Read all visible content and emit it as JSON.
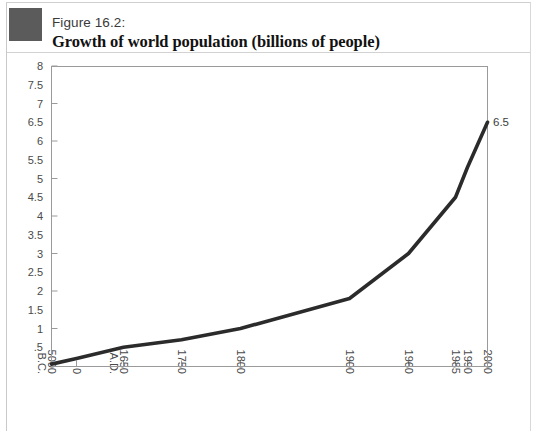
{
  "figure": {
    "number": "Figure 16.2:",
    "title": "Growth of world population (billions of people)",
    "marker_color": "#5b5b5b"
  },
  "chart_data": {
    "type": "line",
    "title": "Growth of world population (billions of people)",
    "subtitle": "Figure 16.2:",
    "xlabel": "",
    "ylabel": "",
    "grid": false,
    "legend": "none",
    "line_color": "#2b2b2b",
    "axis_color": "#9a9a9a",
    "categories": [
      "5000 B.C.",
      "0",
      "1650 A.D.",
      "1750",
      "1800",
      "1900",
      "1960",
      "1985",
      "1990",
      "2000"
    ],
    "category_lines": [
      [
        "5000",
        "B.C."
      ],
      [
        "0"
      ],
      [
        "1650",
        "A.D."
      ],
      [
        "1750"
      ],
      [
        "1800"
      ],
      [
        "1900"
      ],
      [
        "1960"
      ],
      [
        "1985"
      ],
      [
        "1990"
      ],
      [
        "2000"
      ]
    ],
    "x_positions": [
      51,
      76,
      123,
      181,
      240,
      349,
      408,
      455,
      467,
      487
    ],
    "values": [
      0.05,
      0.2,
      0.5,
      0.7,
      1.0,
      1.8,
      3.0,
      4.5,
      5.3,
      6.5
    ],
    "point_labels": [
      "",
      "",
      "",
      "",
      "",
      "",
      "",
      "",
      "",
      "6.5"
    ],
    "ylim": [
      0,
      8
    ],
    "ytick_values": [
      0,
      0.5,
      1,
      1.5,
      2,
      2.5,
      3,
      3.5,
      4,
      4.5,
      5,
      5.5,
      6,
      6.5,
      7,
      7.5,
      8
    ],
    "ytick_labels": [
      "",
      ".5",
      "1",
      "1.5",
      "2",
      "2.5",
      "3",
      "3.5",
      "4",
      "4.5",
      "5",
      "5.5",
      "6",
      "6.5",
      "7",
      "7.5",
      "8"
    ],
    "ymajor_ticks": [
      1,
      2,
      3,
      4,
      5,
      6,
      7,
      8
    ]
  }
}
